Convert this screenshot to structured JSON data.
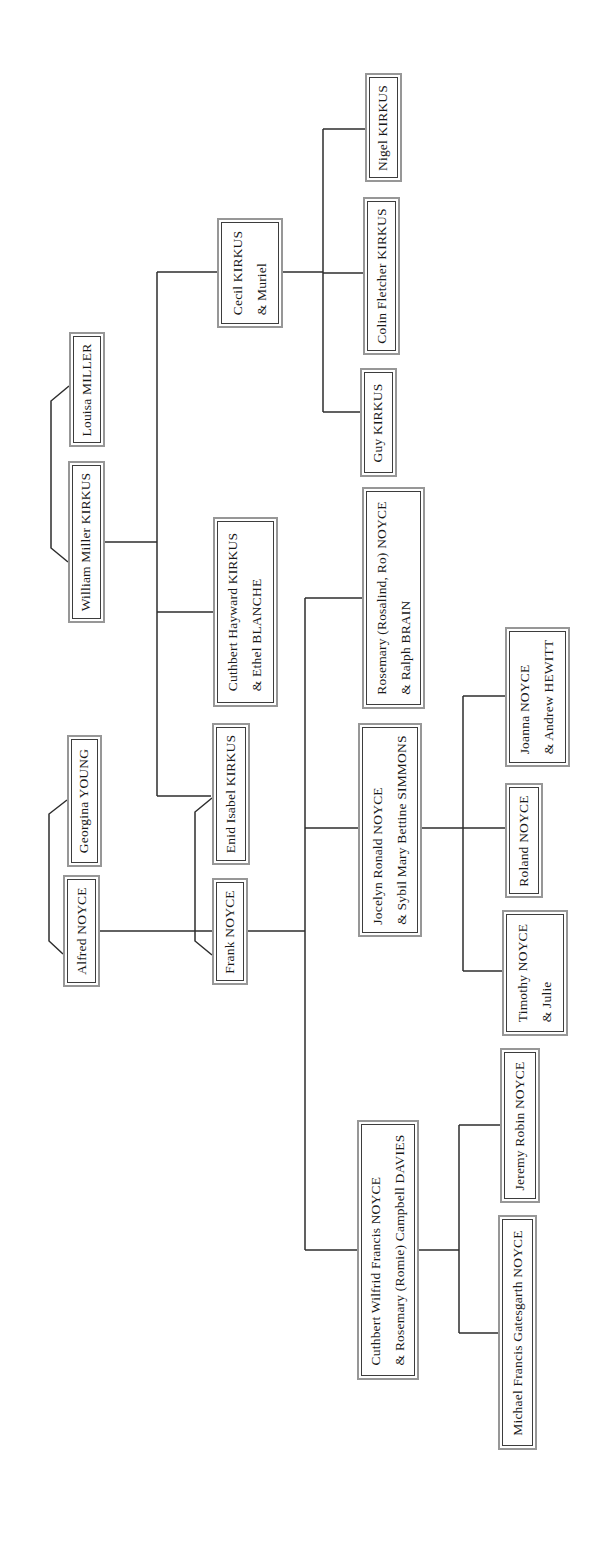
{
  "diagram": {
    "type": "family-tree",
    "text_orientation": "rotated-90-ccw"
  },
  "people": [
    {
      "id": "louisa-miller",
      "display": "Louisa MILLER",
      "box": {
        "x": 69,
        "y": 332,
        "w": 36,
        "h": 115
      }
    },
    {
      "id": "william-miller-kirkus",
      "display": "William Miller KIRKUS",
      "box": {
        "x": 68,
        "y": 461,
        "w": 37,
        "h": 162
      }
    },
    {
      "id": "georgina-young",
      "display": "Georgina YOUNG",
      "box": {
        "x": 67,
        "y": 735,
        "w": 35,
        "h": 132
      }
    },
    {
      "id": "alfred-noyce",
      "display": "Alfred NOYCE",
      "box": {
        "x": 63,
        "y": 875,
        "w": 37,
        "h": 112
      }
    },
    {
      "id": "cecil-kirkus",
      "display": "Cecil KIRKUS\n& Muriel",
      "box": {
        "x": 217,
        "y": 218,
        "w": 66,
        "h": 110
      }
    },
    {
      "id": "cuthbert-hayward-kirkus",
      "display": "Cuthbert Hayward KIRKUS\n& Ethel BLANCHE",
      "box": {
        "x": 213,
        "y": 517,
        "w": 65,
        "h": 190
      }
    },
    {
      "id": "enid-isabel-kirkus",
      "display": "Enid Isabel KIRKUS",
      "box": {
        "x": 212,
        "y": 723,
        "w": 38,
        "h": 142
      }
    },
    {
      "id": "frank-noyce",
      "display": "Frank NOYCE",
      "box": {
        "x": 212,
        "y": 878,
        "w": 36,
        "h": 107
      }
    },
    {
      "id": "nigel-kirkus",
      "display": "Nigel KIRKUS",
      "box": {
        "x": 365,
        "y": 73,
        "w": 37,
        "h": 109
      }
    },
    {
      "id": "colin-fletcher-kirkus",
      "display": "Colin Fletcher KIRKUS",
      "box": {
        "x": 363,
        "y": 197,
        "w": 37,
        "h": 158
      }
    },
    {
      "id": "guy-kirkus",
      "display": "Guy KIRKUS",
      "box": {
        "x": 360,
        "y": 368,
        "w": 37,
        "h": 109
      }
    },
    {
      "id": "rosemary-noyce",
      "display": "Rosemary (Rosalind, Ro) NOYCE\n& Ralph BRAIN",
      "box": {
        "x": 362,
        "y": 487,
        "w": 63,
        "h": 222
      }
    },
    {
      "id": "jocelyn-ronald-noyce",
      "display": "Jocelyn Ronald NOYCE\n& Sybil Mary Bettine SIMMONS",
      "box": {
        "x": 358,
        "y": 723,
        "w": 64,
        "h": 214
      }
    },
    {
      "id": "cuthbert-wilfrid-noyce",
      "display": "Cuthbert Wilfrid Francis NOYCE\n& Rosemary (Romie) Campbell DAVIES",
      "box": {
        "x": 357,
        "y": 1120,
        "w": 62,
        "h": 260
      }
    },
    {
      "id": "joanna-noyce",
      "display": "Joanna NOYCE\n& Andrew HEWITT",
      "box": {
        "x": 505,
        "y": 627,
        "w": 65,
        "h": 140
      }
    },
    {
      "id": "roland-noyce",
      "display": "Roland NOYCE",
      "box": {
        "x": 505,
        "y": 783,
        "w": 38,
        "h": 115
      }
    },
    {
      "id": "timothy-noyce",
      "display": "Timothy NOYCE\n& Julie",
      "box": {
        "x": 502,
        "y": 910,
        "w": 66,
        "h": 126
      }
    },
    {
      "id": "jeremy-robin-noyce",
      "display": "Jeremy Robin NOYCE",
      "box": {
        "x": 500,
        "y": 1048,
        "w": 40,
        "h": 155
      }
    },
    {
      "id": "michael-noyce",
      "display": "Michael Francis Gatesgarth NOYCE",
      "box": {
        "x": 498,
        "y": 1215,
        "w": 39,
        "h": 235
      }
    }
  ],
  "marriages": [
    [
      "william-miller-kirkus",
      "louisa-miller"
    ],
    [
      "alfred-noyce",
      "georgina-young"
    ],
    [
      "frank-noyce",
      "enid-isabel-kirkus"
    ]
  ],
  "families": [
    {
      "parents": [
        "william-miller-kirkus",
        "louisa-miller"
      ],
      "children": [
        "cecil-kirkus",
        "cuthbert-hayward-kirkus",
        "enid-isabel-kirkus"
      ]
    },
    {
      "parents": [
        "alfred-noyce",
        "georgina-young"
      ],
      "children": [
        "frank-noyce"
      ]
    },
    {
      "parents": [
        "cecil-kirkus"
      ],
      "children": [
        "nigel-kirkus",
        "colin-fletcher-kirkus",
        "guy-kirkus"
      ]
    },
    {
      "parents": [
        "frank-noyce",
        "enid-isabel-kirkus"
      ],
      "children": [
        "rosemary-noyce",
        "jocelyn-ronald-noyce",
        "cuthbert-wilfrid-noyce"
      ]
    },
    {
      "parents": [
        "jocelyn-ronald-noyce"
      ],
      "children": [
        "joanna-noyce",
        "roland-noyce",
        "timothy-noyce"
      ]
    },
    {
      "parents": [
        "cuthbert-wilfrid-noyce"
      ],
      "children": [
        "jeremy-robin-noyce",
        "michael-noyce"
      ]
    }
  ]
}
